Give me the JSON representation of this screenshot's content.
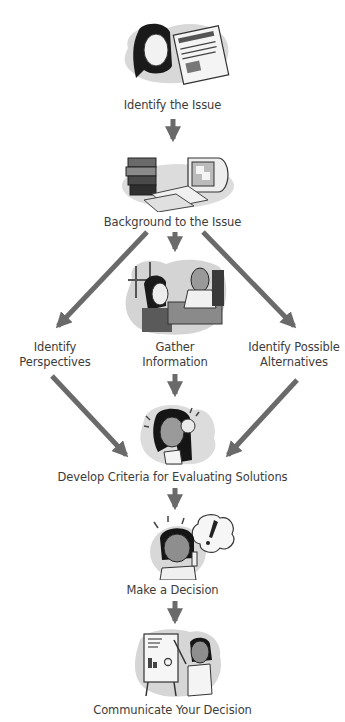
{
  "diagram": {
    "type": "flowchart",
    "arrow_color": "#6a6a6a",
    "nodes": [
      {
        "id": "identify_issue",
        "label": "Identify the Issue",
        "illustration": "woman-reading-newspaper",
        "newspaper_headline": "HOW WILL VACANT LOT BE USED?"
      },
      {
        "id": "background",
        "label": "Background to the Issue",
        "illustration": "books-and-computer"
      },
      {
        "id": "perspectives",
        "label_lines": [
          "Identify",
          "Perspectives"
        ]
      },
      {
        "id": "gather",
        "label_lines": [
          "Gather",
          "Information"
        ],
        "illustration": "woman-talking-to-man"
      },
      {
        "id": "alternatives",
        "label_lines": [
          "Identify Possible",
          "Alternatives"
        ]
      },
      {
        "id": "criteria",
        "label": "Develop Criteria for Evaluating Solutions",
        "illustration": "woman-thinking"
      },
      {
        "id": "decision",
        "label": "Make a Decision",
        "illustration": "woman-with-idea-exclamation"
      },
      {
        "id": "communicate",
        "label": "Communicate Your Decision",
        "illustration": "woman-presenting-easel"
      }
    ],
    "edges": [
      {
        "from": "identify_issue",
        "to": "background"
      },
      {
        "from": "background",
        "to": "perspectives"
      },
      {
        "from": "background",
        "to": "gather"
      },
      {
        "from": "background",
        "to": "alternatives"
      },
      {
        "from": "perspectives",
        "to": "criteria"
      },
      {
        "from": "gather",
        "to": "criteria"
      },
      {
        "from": "alternatives",
        "to": "criteria"
      },
      {
        "from": "criteria",
        "to": "decision"
      },
      {
        "from": "decision",
        "to": "communicate"
      }
    ]
  }
}
